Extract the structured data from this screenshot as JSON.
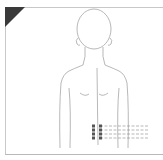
{
  "diagram": {
    "title": "",
    "corner_marker_color": "#3a3a3a",
    "line_color": "#9a9a9a",
    "point_color": "#555555",
    "points": {
      "columns": 2,
      "rows": 4,
      "region": "lower back, either side of spine"
    },
    "guide_lines": 4
  }
}
